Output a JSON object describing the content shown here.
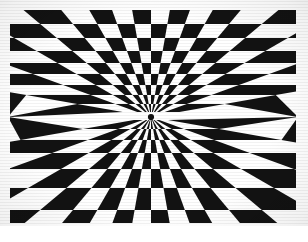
{
  "image": {
    "title": "Radial Checkerboard Tunnel Illusion",
    "description": "High-contrast black-and-white op-art drawing: a sunburst of wedge rays radiating from a single vanishing point, crossed by horizontal bands, forming a checkerboard that appears to recede into a tunnel.",
    "medium": "ink on paper, photocopied reproduction",
    "alt_text": "Black and white optical illusion of a checkerboard funnel converging on a central point",
    "palette": {
      "ink": "#121212",
      "paper": "#ffffff",
      "page_background": "#ffffff"
    }
  },
  "canvas": {
    "width": 308,
    "height": 242
  },
  "artwork_bounds": {
    "left": 10,
    "top": 10,
    "right": 296,
    "bottom": 223,
    "width": 286,
    "height": 213
  },
  "chart_data": {
    "type": "polar-checkerboard",
    "xlabel": "",
    "ylabel": "",
    "vanishing_point": {
      "x": 151,
      "y": 117
    },
    "ray_count": 36,
    "ray_start_angle_deg": 0,
    "ray_angular_pitch_deg": 10,
    "band_count": 15,
    "band_rows_y": [
      10,
      24,
      38,
      51,
      63,
      74,
      85,
      95,
      104,
      112,
      120,
      129,
      140,
      153,
      169,
      188,
      210,
      223
    ],
    "parity_rule": "cell filled when (ray_index + band_index) is even",
    "grid": false,
    "legend": "none",
    "series": [
      {
        "name": "black wedge cells",
        "color": "#121212",
        "description": "alternating dark quadrilateral cells formed by ray pairs intersecting band pairs"
      },
      {
        "name": "white wedge cells",
        "color": "#ffffff",
        "description": "alternating light quadrilateral cells formed by ray pairs intersecting band pairs"
      }
    ]
  },
  "annotations": {
    "center_label": "",
    "edge_label": "",
    "signature": ""
  }
}
